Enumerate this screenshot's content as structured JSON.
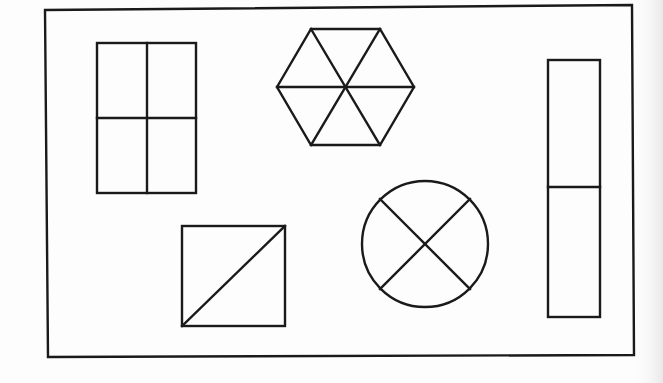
{
  "diagram": {
    "width": 663,
    "height": 383,
    "background": "#fdfdfd",
    "stroke_color": "#1a1a1a",
    "frame": {
      "points": [
        [
          45,
          10
        ],
        [
          632,
          5
        ],
        [
          634,
          355
        ],
        [
          48,
          357
        ]
      ]
    },
    "shapes": [
      {
        "id": "window-rectangle",
        "type": "rect-divided",
        "description": "rectangle divided into four equal parts",
        "x": 97,
        "y": 43,
        "w": 99,
        "h": 150,
        "lines": [
          [
            [
              147,
              43
            ],
            [
              147,
              193
            ]
          ],
          [
            [
              97,
              118
            ],
            [
              196,
              118
            ]
          ]
        ],
        "parts": 4
      },
      {
        "id": "hexagon",
        "type": "hexagon-divided",
        "description": "regular hexagon divided into six triangles",
        "points": [
          [
            277,
            87
          ],
          [
            311,
            29
          ],
          [
            380,
            29
          ],
          [
            414,
            87
          ],
          [
            380,
            145
          ],
          [
            311,
            145
          ]
        ],
        "center": [
          346,
          87
        ],
        "parts": 6
      },
      {
        "id": "tall-rectangle",
        "type": "rect-divided",
        "description": "tall rectangle divided into two parts",
        "x": 548,
        "y": 60,
        "w": 52,
        "h": 257,
        "lines": [
          [
            [
              548,
              187
            ],
            [
              600,
              187
            ]
          ]
        ],
        "parts": 2
      },
      {
        "id": "square-diagonal",
        "type": "rect-divided",
        "description": "square divided by a diagonal into two triangles",
        "x": 182,
        "y": 226,
        "w": 103,
        "h": 100,
        "lines": [
          [
            [
              182,
              326
            ],
            [
              285,
              226
            ]
          ]
        ],
        "parts": 2
      },
      {
        "id": "circle-x",
        "type": "circle-divided",
        "description": "circle divided into four parts by two diagonals",
        "cx": 425,
        "cy": 244,
        "r": 63,
        "lines": [
          [
            [
              380,
              199
            ],
            [
              470,
              289
            ]
          ],
          [
            [
              470,
              199
            ],
            [
              380,
              289
            ]
          ]
        ],
        "parts": 4
      }
    ]
  }
}
